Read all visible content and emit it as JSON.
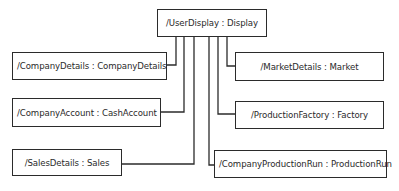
{
  "diagram": {
    "type": "object-composition",
    "colors": {
      "line": "#2b2b2b",
      "text": "#2a2a2a",
      "background": "#ffffff"
    },
    "root": {
      "id": "user-display",
      "label": "/UserDisplay : Display"
    },
    "children": [
      {
        "id": "company-details",
        "label": "/CompanyDetails : CompanyDetails",
        "side": "left"
      },
      {
        "id": "company-account",
        "label": "/CompanyAccount : CashAccount",
        "side": "left"
      },
      {
        "id": "sales-details",
        "label": "/SalesDetails : Sales",
        "side": "left"
      },
      {
        "id": "market-details",
        "label": "/MarketDetails : Market",
        "side": "right"
      },
      {
        "id": "production-factory",
        "label": "/ProductionFactory : Factory",
        "side": "right"
      },
      {
        "id": "company-production-run",
        "label": "/CompanyProductionRun : ProductionRun",
        "side": "right"
      }
    ]
  }
}
